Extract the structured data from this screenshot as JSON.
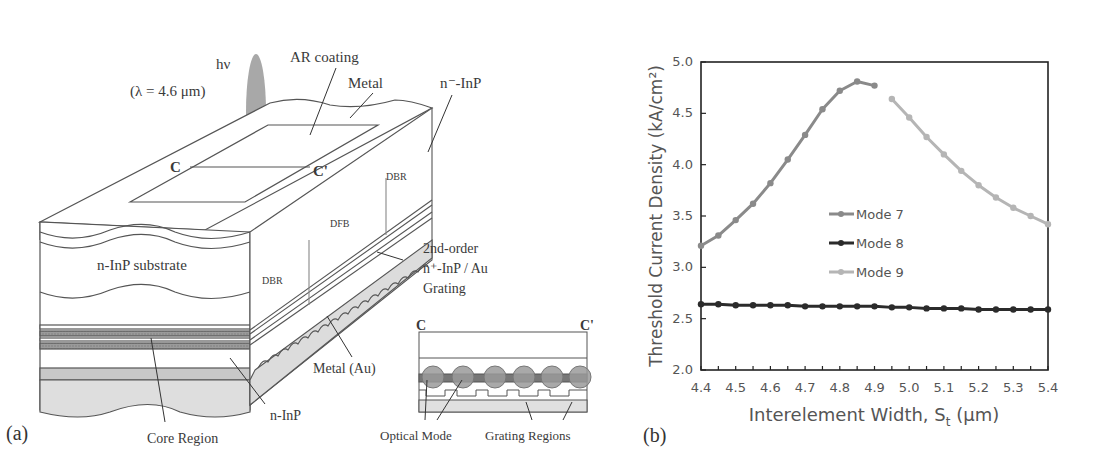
{
  "figure": {
    "panel_a": {
      "label": "(a)",
      "annotations": {
        "photon": "hν",
        "wavelength": "(λ = 4.6 μm)",
        "ar_coating": "AR coating",
        "metal_top": "Metal",
        "n_minus_inp": "n⁻-InP",
        "section_c": "C",
        "section_c_prime": "C'",
        "dbr_right": "DBR",
        "dfb": "DFB",
        "dbr_left": "DBR",
        "substrate": "n-InP substrate",
        "grating_line1": "2nd-order",
        "grating_line2": "n⁺-InP / Au",
        "grating_line3": "Grating",
        "metal_au": "Metal (Au)",
        "n_inp": "n-InP",
        "core_region": "Core Region"
      },
      "inset": {
        "left_label": "C",
        "right_label": "C'",
        "optical_mode": "Optical Mode",
        "grating_regions": "Grating Regions"
      }
    },
    "panel_b": {
      "label": "(b)"
    }
  },
  "chart_data": {
    "type": "line",
    "title": "",
    "xlabel": "Interelement Width, St (μm)",
    "xlabel_main": "Interelement Width, S",
    "xlabel_sub": "t",
    "xlabel_unit": " (μm)",
    "ylabel": "Threshold Current Density (kA/cm²)",
    "xlim": [
      4.4,
      5.4
    ],
    "ylim": [
      2.0,
      5.0
    ],
    "xticks": [
      "4.4",
      "4.5",
      "4.6",
      "4.7",
      "4.8",
      "4.9",
      "5.0",
      "5.1",
      "5.2",
      "5.3",
      "5.4"
    ],
    "yticks": [
      "2.0",
      "2.5",
      "3.0",
      "3.5",
      "4.0",
      "4.5",
      "5.0"
    ],
    "grid": false,
    "legend_position": "center-left inside",
    "series": [
      {
        "name": "Mode 7",
        "color": "#8a8a8a",
        "x": [
          4.4,
          4.45,
          4.5,
          4.55,
          4.6,
          4.65,
          4.7,
          4.75,
          4.8,
          4.85,
          4.9
        ],
        "values": [
          3.21,
          3.31,
          3.46,
          3.62,
          3.82,
          4.05,
          4.29,
          4.54,
          4.72,
          4.81,
          4.77
        ]
      },
      {
        "name": "Mode 8",
        "color": "#2b2b2b",
        "x": [
          4.4,
          4.45,
          4.5,
          4.55,
          4.6,
          4.65,
          4.7,
          4.75,
          4.8,
          4.85,
          4.9,
          4.95,
          5.0,
          5.05,
          5.1,
          5.15,
          5.2,
          5.25,
          5.3,
          5.35,
          5.4
        ],
        "values": [
          2.64,
          2.64,
          2.63,
          2.63,
          2.63,
          2.63,
          2.62,
          2.62,
          2.62,
          2.62,
          2.62,
          2.61,
          2.61,
          2.6,
          2.6,
          2.6,
          2.59,
          2.59,
          2.59,
          2.59,
          2.59
        ]
      },
      {
        "name": "Mode 9",
        "color": "#b5b5b5",
        "x": [
          4.95,
          5.0,
          5.05,
          5.1,
          5.15,
          5.2,
          5.25,
          5.3,
          5.35,
          5.4
        ],
        "values": [
          4.64,
          4.46,
          4.27,
          4.1,
          3.94,
          3.8,
          3.68,
          3.58,
          3.5,
          3.42
        ]
      }
    ]
  }
}
